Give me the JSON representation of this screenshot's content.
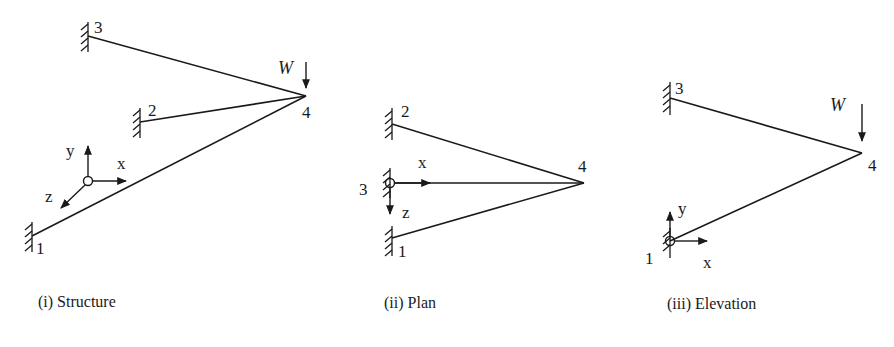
{
  "figure": {
    "panels": [
      {
        "id": "structure",
        "caption": "(i) Structure",
        "nodes": [
          {
            "label": "1",
            "x": 32,
            "y": 236,
            "support": "fixed"
          },
          {
            "label": "2",
            "x": 140,
            "y": 122,
            "support": "fixed"
          },
          {
            "label": "3",
            "x": 88,
            "y": 36,
            "support": "fixed"
          },
          {
            "label": "4",
            "x": 306,
            "y": 96,
            "support": "free"
          }
        ],
        "members": [
          [
            "1",
            "4"
          ],
          [
            "2",
            "4"
          ],
          [
            "3",
            "4"
          ]
        ],
        "load": {
          "label": "W",
          "direction": "down"
        },
        "axes": {
          "x": "x",
          "y": "y",
          "z": "z"
        }
      },
      {
        "id": "plan",
        "caption": "(ii) Plan",
        "nodes": [
          {
            "label": "1",
            "x": 392,
            "y": 238,
            "support": "fixed"
          },
          {
            "label": "2",
            "x": 392,
            "y": 124,
            "support": "fixed"
          },
          {
            "label": "3",
            "x": 390,
            "y": 183,
            "support": "fixed"
          },
          {
            "label": "4",
            "x": 584,
            "y": 183,
            "support": "free"
          }
        ],
        "members": [
          [
            "1",
            "4"
          ],
          [
            "2",
            "4"
          ],
          [
            "3",
            "4"
          ]
        ],
        "axes": {
          "x": "x",
          "z": "z"
        }
      },
      {
        "id": "elevation",
        "caption": "(iii) Elevation",
        "nodes": [
          {
            "label": "1",
            "x": 670,
            "y": 241,
            "support": "fixed"
          },
          {
            "label": "3",
            "x": 670,
            "y": 98,
            "support": "fixed"
          },
          {
            "label": "4",
            "x": 862,
            "y": 153,
            "support": "free"
          }
        ],
        "members": [
          [
            "1",
            "4"
          ],
          [
            "3",
            "4"
          ]
        ],
        "load": {
          "label": "W",
          "direction": "down"
        },
        "axes": {
          "x": "x",
          "y": "y"
        }
      }
    ],
    "colors": {
      "ink": "#1a1a1a",
      "background": "#ffffff"
    }
  }
}
